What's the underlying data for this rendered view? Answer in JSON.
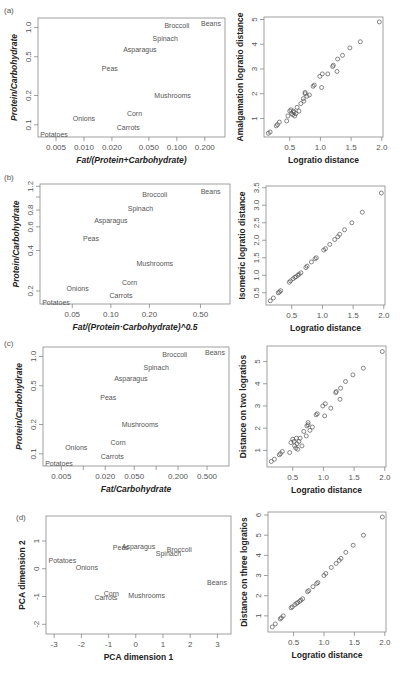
{
  "chart_data": [
    {
      "panel": "(a)",
      "type": "scatter",
      "title": "",
      "xlabel": "Fat/(Protein+Carbohydrate)",
      "ylabel": "Protein/Carbohydrate",
      "xscale": "log",
      "yscale": "log",
      "xticks": [
        "0.005",
        "0.010",
        "0.020",
        "0.050",
        "0.100",
        "0.200"
      ],
      "yticks": [
        "0.1",
        "0.2",
        "0.5",
        "1.0"
      ],
      "labels": [
        {
          "name": "Beans",
          "x": 0.3,
          "y": 1.1
        },
        {
          "name": "Broccoli",
          "x": 0.1,
          "y": 1.05
        },
        {
          "name": "Spinach",
          "x": 0.075,
          "y": 0.77
        },
        {
          "name": "Asparagus",
          "x": 0.04,
          "y": 0.6
        },
        {
          "name": "Peas",
          "x": 0.019,
          "y": 0.38
        },
        {
          "name": "Mushrooms",
          "x": 0.09,
          "y": 0.2
        },
        {
          "name": "Corn",
          "x": 0.035,
          "y": 0.13
        },
        {
          "name": "Onions",
          "x": 0.01,
          "y": 0.115
        },
        {
          "name": "Carrots",
          "x": 0.03,
          "y": 0.095
        },
        {
          "name": "Potatoes",
          "x": 0.004,
          "y": 0.08
        }
      ]
    },
    {
      "panel": "(a) right",
      "type": "scatter",
      "xlabel": "Logratio distance",
      "ylabel": "Amalgamation logratio distance",
      "xlim": [
        0.1,
        2.0
      ],
      "ylim": [
        0.3,
        5.0
      ],
      "xticks": [
        "0.5",
        "1.0",
        "1.5",
        "2.0"
      ],
      "yticks": [
        "1",
        "2",
        "3",
        "4",
        "5"
      ],
      "x": [
        0.15,
        0.18,
        0.28,
        0.3,
        0.33,
        0.45,
        0.47,
        0.5,
        0.52,
        0.53,
        0.55,
        0.56,
        0.57,
        0.58,
        0.6,
        0.62,
        0.65,
        0.68,
        0.72,
        0.73,
        0.75,
        0.75,
        0.78,
        0.82,
        0.88,
        0.9,
        0.99,
        1.02,
        1.03,
        1.12,
        1.2,
        1.21,
        1.27,
        1.28,
        1.36,
        1.48,
        1.65,
        1.96
      ],
      "y": [
        0.4,
        0.45,
        0.7,
        0.75,
        0.85,
        0.9,
        1.1,
        1.3,
        1.35,
        1.2,
        1.15,
        1.3,
        1.25,
        1.1,
        1.2,
        1.45,
        1.3,
        1.6,
        1.8,
        1.7,
        2.0,
        2.05,
        1.9,
        1.95,
        2.3,
        2.35,
        2.7,
        2.25,
        2.8,
        2.8,
        3.1,
        3.15,
        2.9,
        3.4,
        3.55,
        3.85,
        4.1,
        4.9
      ]
    },
    {
      "panel": "(b)",
      "type": "scatter",
      "xlabel": "Fat/(Protein·Carbohydrate)^0.5",
      "ylabel": "Protein/Carbohydrate",
      "xscale": "log",
      "yscale": "log",
      "xticks": [
        "0.05",
        "0.10",
        "0.20",
        "0.50"
      ],
      "yticks": [
        "0.2",
        "0.4",
        "0.6",
        "0.8",
        "1.2"
      ],
      "labels": [
        {
          "name": "Beans",
          "x": 0.6,
          "y": 1.1
        },
        {
          "name": "Broccoli",
          "x": 0.22,
          "y": 1.05
        },
        {
          "name": "Spinach",
          "x": 0.17,
          "y": 0.82
        },
        {
          "name": "Asparagus",
          "x": 0.1,
          "y": 0.67
        },
        {
          "name": "Peas",
          "x": 0.07,
          "y": 0.49
        },
        {
          "name": "Mushrooms",
          "x": 0.22,
          "y": 0.32
        },
        {
          "name": "Corn",
          "x": 0.14,
          "y": 0.23
        },
        {
          "name": "Onions",
          "x": 0.055,
          "y": 0.21
        },
        {
          "name": "Carrots",
          "x": 0.12,
          "y": 0.185
        },
        {
          "name": "Potatoes",
          "x": 0.033,
          "y": 0.165
        }
      ]
    },
    {
      "panel": "(b) right",
      "type": "scatter",
      "xlabel": "Logratio distance",
      "ylabel": "Isometric logratio distance",
      "xlim": [
        0.1,
        2.0
      ],
      "ylim": [
        0.2,
        3.5
      ],
      "xticks": [
        "0.5",
        "1.0",
        "1.5",
        "2.0"
      ],
      "yticks": [
        "0.5",
        "1.0",
        "1.5",
        "2.0",
        "2.5",
        "3.0",
        "3.5"
      ],
      "x": [
        0.15,
        0.2,
        0.28,
        0.3,
        0.32,
        0.46,
        0.48,
        0.52,
        0.55,
        0.57,
        0.6,
        0.62,
        0.65,
        0.73,
        0.75,
        0.82,
        0.88,
        0.9,
        1.02,
        1.05,
        1.12,
        1.2,
        1.25,
        1.28,
        1.36,
        1.48,
        1.65,
        1.96
      ],
      "y": [
        0.27,
        0.35,
        0.5,
        0.52,
        0.56,
        0.8,
        0.84,
        0.9,
        0.94,
        0.96,
        1.0,
        1.03,
        1.07,
        1.22,
        1.26,
        1.38,
        1.47,
        1.5,
        1.72,
        1.76,
        1.88,
        2.02,
        2.1,
        2.17,
        2.3,
        2.5,
        2.8,
        3.35
      ]
    },
    {
      "panel": "(c)",
      "type": "scatter",
      "xlabel": "Fat/Carbohydrate",
      "ylabel": "Protein/Carbohydrate",
      "xscale": "log",
      "yscale": "log",
      "xticks": [
        "0.005",
        "0.020",
        "0.050",
        "0.200",
        "0.500"
      ],
      "yticks": [
        "0.1",
        "0.2",
        "0.5",
        "1.0"
      ],
      "labels": [
        {
          "name": "Beans",
          "x": 0.7,
          "y": 1.1
        },
        {
          "name": "Broccoli",
          "x": 0.18,
          "y": 1.05
        },
        {
          "name": "Spinach",
          "x": 0.1,
          "y": 0.77
        },
        {
          "name": "Asparagus",
          "x": 0.045,
          "y": 0.6
        },
        {
          "name": "Peas",
          "x": 0.022,
          "y": 0.38
        },
        {
          "name": "Mushrooms",
          "x": 0.06,
          "y": 0.2
        },
        {
          "name": "Corn",
          "x": 0.03,
          "y": 0.13
        },
        {
          "name": "Onions",
          "x": 0.008,
          "y": 0.115
        },
        {
          "name": "Carrots",
          "x": 0.025,
          "y": 0.095
        },
        {
          "name": "Potatoes",
          "x": 0.004,
          "y": 0.08
        }
      ]
    },
    {
      "panel": "(c) right",
      "type": "scatter",
      "xlabel": "Logratio distance",
      "ylabel": "Distance on two logratios",
      "xlim": [
        0.1,
        2.0
      ],
      "ylim": [
        0.3,
        5.5
      ],
      "xticks": [
        "0.5",
        "1.0",
        "1.5",
        "2.0"
      ],
      "yticks": [
        "1",
        "2",
        "3",
        "4",
        "5"
      ],
      "x": [
        0.15,
        0.2,
        0.28,
        0.3,
        0.33,
        0.45,
        0.47,
        0.5,
        0.52,
        0.53,
        0.55,
        0.56,
        0.57,
        0.58,
        0.6,
        0.62,
        0.65,
        0.68,
        0.72,
        0.73,
        0.75,
        0.75,
        0.78,
        0.82,
        0.88,
        0.9,
        0.99,
        1.02,
        1.03,
        1.12,
        1.2,
        1.21,
        1.27,
        1.28,
        1.36,
        1.48,
        1.65,
        1.96
      ],
      "y": [
        0.5,
        0.6,
        0.8,
        0.85,
        0.95,
        0.9,
        1.35,
        1.5,
        1.4,
        1.2,
        1.1,
        1.55,
        1.3,
        1.05,
        1.4,
        1.55,
        1.2,
        1.85,
        1.65,
        2.1,
        2.25,
        2.15,
        1.9,
        2.05,
        2.6,
        2.65,
        3.0,
        2.55,
        3.1,
        2.9,
        3.6,
        3.65,
        3.3,
        3.8,
        4.1,
        4.4,
        4.7,
        5.45
      ]
    },
    {
      "panel": "(d)",
      "type": "scatter",
      "xlabel": "PCA dimension 1",
      "ylabel": "PCA dimension 2",
      "xlim": [
        -3.2,
        3.4
      ],
      "ylim": [
        -2.3,
        1.7
      ],
      "xticks": [
        "-3",
        "-2",
        "-1",
        "0",
        "1",
        "2",
        "3"
      ],
      "yticks": [
        "-2",
        "-1",
        "0",
        "1"
      ],
      "labels": [
        {
          "name": "Peas",
          "x": -0.55,
          "y": 0.78
        },
        {
          "name": "Asparagus",
          "x": 0.1,
          "y": 0.8
        },
        {
          "name": "Broccoli",
          "x": 1.6,
          "y": 0.68
        },
        {
          "name": "Spinach",
          "x": 1.2,
          "y": 0.55
        },
        {
          "name": "Potatoes",
          "x": -2.7,
          "y": 0.3
        },
        {
          "name": "Onions",
          "x": -1.8,
          "y": 0.05
        },
        {
          "name": "Beans",
          "x": 3.0,
          "y": -0.5
        },
        {
          "name": "Corn",
          "x": -0.9,
          "y": -0.88
        },
        {
          "name": "Mushrooms",
          "x": 0.4,
          "y": -0.95
        },
        {
          "name": "Carrots",
          "x": -1.1,
          "y": -1.05
        }
      ]
    },
    {
      "panel": "(d) right",
      "type": "scatter",
      "xlabel": "Logratio distance",
      "ylabel": "Distance on three logratios",
      "xlim": [
        0.1,
        2.0
      ],
      "ylim": [
        0.3,
        6.0
      ],
      "xticks": [
        "0.5",
        "1.0",
        "1.5",
        "2.0"
      ],
      "yticks": [
        "1",
        "2",
        "3",
        "4",
        "5",
        "6"
      ],
      "x": [
        0.15,
        0.2,
        0.28,
        0.3,
        0.33,
        0.46,
        0.48,
        0.52,
        0.55,
        0.57,
        0.6,
        0.62,
        0.65,
        0.73,
        0.75,
        0.82,
        0.88,
        0.9,
        1.0,
        1.03,
        1.12,
        1.2,
        1.25,
        1.28,
        1.36,
        1.48,
        1.65,
        1.96
      ],
      "y": [
        0.45,
        0.6,
        0.85,
        0.9,
        1.0,
        1.4,
        1.45,
        1.55,
        1.62,
        1.66,
        1.72,
        1.78,
        1.85,
        2.2,
        2.25,
        2.45,
        2.6,
        2.65,
        3.0,
        3.1,
        3.4,
        3.6,
        3.75,
        3.85,
        4.15,
        4.5,
        5.0,
        5.9
      ]
    }
  ],
  "panels": {
    "a": {
      "tag": "(a)"
    },
    "b": {
      "tag": "(b)"
    },
    "c": {
      "tag": "(c)"
    },
    "d": {
      "tag": "(d)"
    }
  }
}
